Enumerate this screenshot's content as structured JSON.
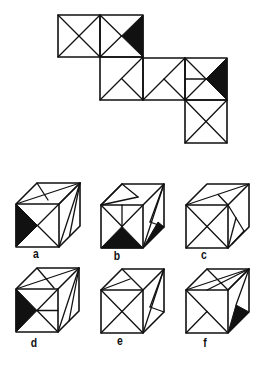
{
  "puzzle": {
    "type": "cube-net-folding",
    "net": {
      "squares": [
        {
          "id": 1,
          "pattern": "x-cross"
        },
        {
          "id": 2,
          "pattern": "left-arrow-with-black-right-triangle"
        },
        {
          "id": 3,
          "pattern": "diagonal-with-center-to-bottom-right"
        },
        {
          "id": 4,
          "pattern": "diagonal-with-center-to-bottom-right"
        },
        {
          "id": 5,
          "pattern": "left-arrow-midline-with-black-right-triangle"
        },
        {
          "id": 6,
          "pattern": "x-cross"
        }
      ]
    },
    "options": [
      {
        "label": "a"
      },
      {
        "label": "b"
      },
      {
        "label": "c"
      },
      {
        "label": "d"
      },
      {
        "label": "e"
      },
      {
        "label": "f"
      }
    ],
    "colors": {
      "ink": "#111111",
      "background": "#ffffff"
    }
  }
}
